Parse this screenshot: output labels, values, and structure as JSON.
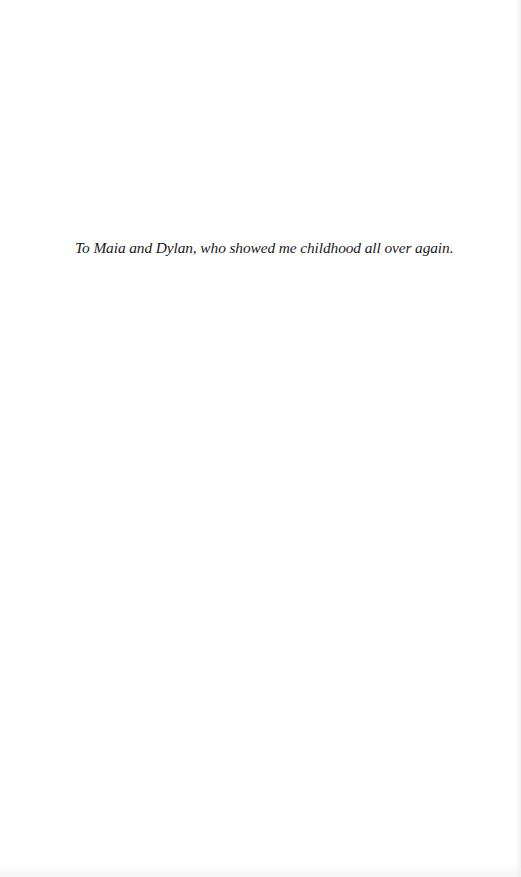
{
  "page": {
    "type": "dedication",
    "background_color": "#ffffff",
    "text_color": "#1a1a1a"
  },
  "dedication": {
    "text": "To Maia and Dylan, who showed me childhood all over again."
  }
}
